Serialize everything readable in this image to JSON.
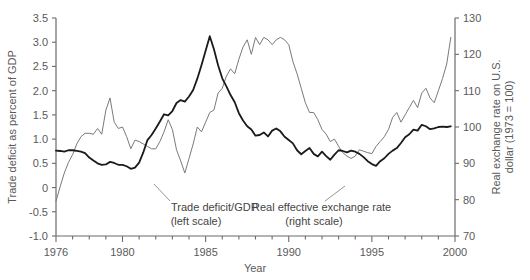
{
  "chart_data": {
    "type": "line",
    "title": "",
    "xlabel": "Year",
    "ylabel": "Trade deficit as percent of GDP",
    "ylabel_right": "Real exchange rate on U.S. dollar (1973 = 100)",
    "xlim": [
      1976,
      2000
    ],
    "ylim": [
      -1.0,
      3.5
    ],
    "ylim_right": [
      70,
      130
    ],
    "xticks_major": [
      1976,
      1980,
      1985,
      1990,
      1995,
      2000
    ],
    "xticks_minor_step": 1,
    "yticks_left": [
      "3.5",
      "3.0",
      "2.5",
      "2.0",
      "1.5",
      "1.0",
      "0.5",
      "0",
      "-0.5",
      "-1.0"
    ],
    "yticks_left_values": [
      3.5,
      3.0,
      2.5,
      2.0,
      1.5,
      1.0,
      0.5,
      0,
      -0.5,
      -1.0
    ],
    "yticks_right": [
      "130",
      "120",
      "110",
      "100",
      "90",
      "80",
      "70"
    ],
    "yticks_right_values": [
      130,
      120,
      110,
      100,
      90,
      80,
      70
    ],
    "grid": false,
    "legend_position": "inline-annotations",
    "annotations": [
      {
        "name": "trade-deficit-annotation",
        "line1": "Trade deficit/GDP",
        "line2": "(left scale)"
      },
      {
        "name": "exchange-rate-annotation",
        "line1": "Real effective exchange rate",
        "line2": "(right scale)"
      }
    ],
    "colors": {
      "trade_deficit": "#7a7a7a",
      "exchange_rate": "#1a1a1a",
      "axis": "#6b6b6b"
    },
    "series": [
      {
        "name": "Trade deficit/GDP",
        "axis": "left",
        "color": "#7a7a7a",
        "width": 1.0,
        "x": [
          1976.0,
          1976.25,
          1976.5,
          1976.75,
          1977.0,
          1977.25,
          1977.5,
          1977.75,
          1978.0,
          1978.25,
          1978.5,
          1978.75,
          1979.0,
          1979.25,
          1979.5,
          1979.75,
          1980.0,
          1980.25,
          1980.5,
          1980.75,
          1981.0,
          1981.25,
          1981.5,
          1981.75,
          1982.0,
          1982.25,
          1982.5,
          1982.75,
          1983.0,
          1983.25,
          1983.5,
          1983.75,
          1984.0,
          1984.25,
          1984.5,
          1984.75,
          1985.0,
          1985.25,
          1985.5,
          1985.75,
          1986.0,
          1986.25,
          1986.5,
          1986.75,
          1987.0,
          1987.25,
          1987.5,
          1987.75,
          1988.0,
          1988.25,
          1988.5,
          1988.75,
          1989.0,
          1989.25,
          1989.5,
          1989.75,
          1990.0,
          1990.25,
          1990.5,
          1990.75,
          1991.0,
          1991.25,
          1991.5,
          1991.75,
          1992.0,
          1992.25,
          1992.5,
          1992.75,
          1993.0,
          1993.25,
          1993.5,
          1993.75,
          1994.0,
          1994.25,
          1994.5,
          1994.75,
          1995.0,
          1995.25,
          1995.5,
          1995.75,
          1996.0,
          1996.25,
          1996.5,
          1996.75,
          1997.0,
          1997.25,
          1997.5,
          1997.75,
          1998.0,
          1998.25,
          1998.5,
          1998.75,
          1999.0,
          1999.25,
          1999.5,
          1999.75
        ],
        "y": [
          -0.28,
          0.02,
          0.3,
          0.52,
          0.68,
          0.9,
          1.05,
          1.12,
          1.12,
          1.1,
          1.22,
          1.1,
          1.6,
          1.85,
          1.35,
          1.22,
          1.25,
          1.05,
          0.8,
          0.98,
          0.95,
          0.9,
          0.85,
          0.8,
          0.8,
          0.95,
          1.15,
          1.4,
          1.2,
          0.78,
          0.55,
          0.3,
          0.6,
          0.9,
          1.25,
          1.15,
          1.35,
          1.55,
          1.6,
          1.95,
          2.05,
          2.3,
          2.45,
          2.35,
          2.65,
          2.9,
          3.05,
          2.75,
          3.1,
          2.95,
          3.1,
          3.05,
          2.95,
          3.05,
          3.1,
          3.05,
          2.95,
          2.6,
          2.35,
          2.05,
          1.75,
          1.55,
          1.55,
          1.4,
          1.2,
          1.1,
          0.95,
          1.0,
          0.85,
          0.72,
          0.65,
          0.6,
          0.65,
          0.78,
          0.75,
          0.72,
          0.7,
          0.85,
          0.95,
          1.05,
          1.2,
          1.45,
          1.55,
          1.35,
          1.5,
          1.65,
          1.8,
          1.65,
          1.95,
          2.05,
          1.85,
          1.75,
          2.0,
          2.25,
          2.55,
          3.1
        ]
      },
      {
        "name": "Real effective exchange rate",
        "axis": "right",
        "color": "#1a1a1a",
        "width": 1.8,
        "x": [
          1976.0,
          1976.25,
          1976.5,
          1976.75,
          1977.0,
          1977.25,
          1977.5,
          1977.75,
          1978.0,
          1978.25,
          1978.5,
          1978.75,
          1979.0,
          1979.25,
          1979.5,
          1979.75,
          1980.0,
          1980.25,
          1980.5,
          1980.75,
          1981.0,
          1981.25,
          1981.5,
          1981.75,
          1982.0,
          1982.25,
          1982.5,
          1982.75,
          1983.0,
          1983.25,
          1983.5,
          1983.75,
          1984.0,
          1984.25,
          1984.5,
          1984.75,
          1985.0,
          1985.25,
          1985.5,
          1985.75,
          1986.0,
          1986.25,
          1986.5,
          1986.75,
          1987.0,
          1987.25,
          1987.5,
          1987.75,
          1988.0,
          1988.25,
          1988.5,
          1988.75,
          1989.0,
          1989.25,
          1989.5,
          1989.75,
          1990.0,
          1990.25,
          1990.5,
          1990.75,
          1991.0,
          1991.25,
          1991.5,
          1991.75,
          1992.0,
          1992.25,
          1992.5,
          1992.75,
          1993.0,
          1993.25,
          1993.5,
          1993.75,
          1994.0,
          1994.25,
          1994.5,
          1994.75,
          1995.0,
          1995.25,
          1995.5,
          1995.75,
          1996.0,
          1996.25,
          1996.5,
          1996.75,
          1997.0,
          1997.25,
          1997.5,
          1997.75,
          1998.0,
          1998.25,
          1998.5,
          1998.75,
          1999.0,
          1999.25,
          1999.5,
          1999.75
        ],
        "y": [
          93.5,
          93.4,
          93.2,
          93.6,
          93.6,
          93.4,
          93.2,
          92.8,
          91.6,
          90.8,
          90.0,
          89.6,
          89.7,
          90.4,
          90.1,
          89.6,
          89.6,
          89.2,
          88.5,
          88.8,
          90.2,
          93.0,
          96.4,
          97.8,
          99.6,
          101.5,
          103.5,
          103.2,
          104.4,
          106.6,
          107.4,
          107.0,
          108.4,
          110.2,
          113.3,
          117.0,
          121.0,
          125.0,
          121.4,
          117.0,
          113.4,
          111.2,
          108.8,
          106.8,
          103.8,
          101.8,
          100.2,
          99.3,
          97.6,
          97.8,
          98.5,
          97.4,
          99.0,
          99.6,
          98.8,
          97.3,
          96.4,
          95.5,
          93.6,
          92.5,
          93.4,
          94.2,
          92.6,
          91.9,
          93.2,
          92.0,
          91.0,
          92.4,
          93.6,
          93.4,
          93.0,
          93.5,
          93.2,
          92.6,
          91.7,
          90.6,
          89.8,
          89.3,
          90.6,
          91.4,
          92.6,
          93.5,
          94.2,
          95.6,
          97.2,
          98.0,
          99.3,
          99.0,
          100.6,
          100.2,
          99.4,
          99.6,
          100.0,
          100.1,
          100.0,
          100.2
        ]
      }
    ]
  }
}
